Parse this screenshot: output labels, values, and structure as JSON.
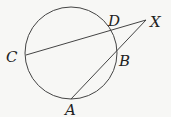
{
  "diagram": {
    "type": "circle-secants",
    "circle": {
      "cx": 71,
      "cy": 53,
      "r": 46
    },
    "points": {
      "C": {
        "x": 26,
        "y": 55,
        "label": "C",
        "lx": 6,
        "ly": 62
      },
      "D": {
        "x": 110,
        "y": 30,
        "label": "D",
        "lx": 108,
        "ly": 26
      },
      "X": {
        "x": 146,
        "y": 20,
        "label": "X",
        "lx": 150,
        "ly": 27
      },
      "B": {
        "x": 116,
        "y": 51,
        "label": "B",
        "lx": 119,
        "ly": 66
      },
      "A": {
        "x": 71,
        "y": 99,
        "label": "A",
        "lx": 65,
        "ly": 115
      }
    },
    "segments": [
      [
        "C",
        "X"
      ],
      [
        "A",
        "X"
      ]
    ],
    "stroke_color": "#444444"
  }
}
